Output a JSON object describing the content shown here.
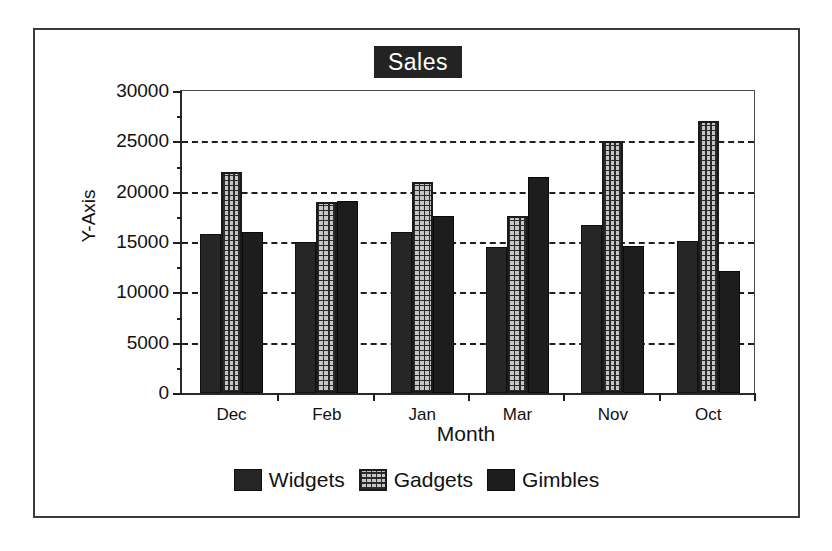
{
  "chart_data": {
    "type": "bar",
    "title": "Sales",
    "xlabel": "Month",
    "ylabel": "Y-Axis",
    "categories": [
      "Dec",
      "Feb",
      "Jan",
      "Mar",
      "Nov",
      "Oct"
    ],
    "series": [
      {
        "name": "Widgets",
        "values": [
          15800,
          15000,
          16000,
          14500,
          16700,
          15100
        ],
        "color": "#262626",
        "pattern": "solid-dark"
      },
      {
        "name": "Gadgets",
        "values": [
          22000,
          19000,
          21000,
          17600,
          25000,
          27000
        ],
        "color": "#c6c6c6",
        "pattern": "dotted-grid"
      },
      {
        "name": "Gimbles",
        "values": [
          16000,
          19100,
          17600,
          21500,
          14600,
          12100
        ],
        "color": "#1d1d1d",
        "pattern": "solid-dark"
      }
    ],
    "ylim": [
      0,
      30000
    ],
    "yticks": [
      0,
      5000,
      10000,
      15000,
      20000,
      25000,
      30000
    ],
    "ytick_labels": [
      "0",
      "5000",
      "10000",
      "15000",
      "20000",
      "25000",
      "30000"
    ],
    "yminor_ticks": [
      2500,
      7500,
      12500,
      17500,
      22500,
      27500
    ],
    "grid": true,
    "grid_style": "dashed-horizontal",
    "legend_position": "bottom",
    "frame": true
  },
  "colors": {
    "axis": "#1f1f1f",
    "grid": "#1f1f1f",
    "frame": "#3b3b3b",
    "title_background": "#232323",
    "title_text": "#ffffff",
    "background": "#ffffff"
  }
}
